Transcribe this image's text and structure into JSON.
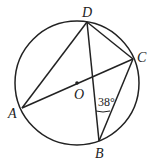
{
  "diagram": {
    "type": "circle-geometry",
    "points": {
      "A": {
        "label": "A"
      },
      "B": {
        "label": "B"
      },
      "C": {
        "label": "C"
      },
      "D": {
        "label": "D"
      },
      "O": {
        "label": "O"
      }
    },
    "segments": [
      "AD",
      "DC",
      "DB",
      "AC",
      "CB"
    ],
    "angle_annotation": {
      "vertex": "B",
      "between": [
        "BD",
        "BC"
      ],
      "label": "38°"
    },
    "stroke_color": "#222222"
  }
}
